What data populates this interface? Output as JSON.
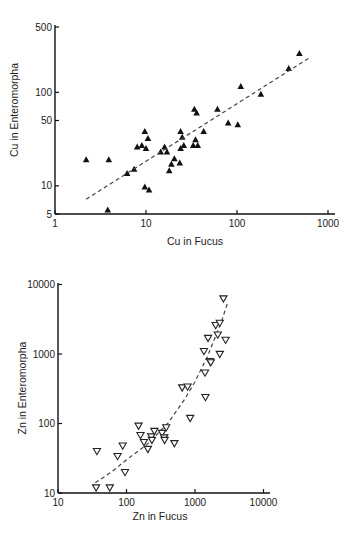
{
  "chart_data": [
    {
      "type": "scatter",
      "title": "",
      "xlabel": "Cu in Fucus",
      "ylabel": "Cu in Enteromorpha",
      "xscale": "log",
      "yscale": "log",
      "xlim": [
        1,
        1000
      ],
      "ylim": [
        5,
        500
      ],
      "xticks": [
        1,
        10,
        100,
        1000
      ],
      "xtick_labels": [
        "1",
        "10",
        "100",
        "1000"
      ],
      "yticks": [
        5,
        10,
        50,
        100,
        500
      ],
      "ytick_labels": [
        "5",
        "10",
        "50",
        "100",
        "500"
      ],
      "grid": false,
      "legend": null,
      "marker": "filled-triangle-up",
      "fit_line": {
        "style": "dashed",
        "from": [
          2.2,
          7.2
        ],
        "to": [
          650,
          240
        ]
      },
      "points": [
        [
          2.2,
          19
        ],
        [
          3.9,
          19
        ],
        [
          3.8,
          5.5
        ],
        [
          6.2,
          13.5
        ],
        [
          7.4,
          15
        ],
        [
          8,
          26
        ],
        [
          9,
          27
        ],
        [
          9.7,
          38
        ],
        [
          10,
          25
        ],
        [
          10.5,
          32
        ],
        [
          9.7,
          9.7
        ],
        [
          10.8,
          9
        ],
        [
          14.5,
          23
        ],
        [
          16,
          26
        ],
        [
          17,
          23
        ],
        [
          19,
          17
        ],
        [
          20.5,
          19.5
        ],
        [
          18,
          14.5
        ],
        [
          23.5,
          17.5
        ],
        [
          24,
          38
        ],
        [
          25,
          33
        ],
        [
          24,
          25
        ],
        [
          26,
          27
        ],
        [
          33,
          27
        ],
        [
          34,
          66
        ],
        [
          36,
          60
        ],
        [
          35,
          31
        ],
        [
          37,
          27
        ],
        [
          43,
          38
        ],
        [
          61,
          66
        ],
        [
          80,
          47
        ],
        [
          102,
          45
        ],
        [
          110,
          115
        ],
        [
          183,
          95
        ],
        [
          370,
          180
        ],
        [
          485,
          260
        ]
      ]
    },
    {
      "type": "scatter",
      "title": "",
      "xlabel": "Zn in Fucus",
      "ylabel": "Zn in Enteromorpha",
      "xscale": "log",
      "yscale": "log",
      "xlim": [
        10,
        10000
      ],
      "ylim": [
        10,
        10000
      ],
      "xticks": [
        10,
        100,
        1000,
        10000
      ],
      "xtick_labels": [
        "10",
        "100",
        "1000",
        "10000"
      ],
      "yticks": [
        10,
        100,
        1000,
        10000
      ],
      "ytick_labels": [
        "10",
        "100",
        "1000",
        "10000"
      ],
      "grid": false,
      "legend": null,
      "marker": "open-triangle-down",
      "fit_line": {
        "style": "dashed",
        "curve": [
          [
            35,
            14
          ],
          [
            60,
            20
          ],
          [
            100,
            30
          ],
          [
            200,
            50
          ],
          [
            400,
            100
          ],
          [
            700,
            220
          ],
          [
            1000,
            400
          ],
          [
            1500,
            900
          ],
          [
            2000,
            1800
          ],
          [
            2500,
            3200
          ],
          [
            3000,
            5500
          ]
        ]
      },
      "points": [
        [
          37,
          40
        ],
        [
          36,
          12
        ],
        [
          57,
          12
        ],
        [
          74,
          34
        ],
        [
          88,
          48
        ],
        [
          95,
          20
        ],
        [
          150,
          93
        ],
        [
          160,
          68
        ],
        [
          180,
          54
        ],
        [
          205,
          43
        ],
        [
          230,
          65
        ],
        [
          235,
          58
        ],
        [
          255,
          78
        ],
        [
          330,
          73
        ],
        [
          355,
          63
        ],
        [
          360,
          58
        ],
        [
          380,
          88
        ],
        [
          500,
          52
        ],
        [
          650,
          330
        ],
        [
          780,
          340
        ],
        [
          850,
          120
        ],
        [
          1350,
          1100
        ],
        [
          1400,
          540
        ],
        [
          1420,
          240
        ],
        [
          1550,
          1700
        ],
        [
          1650,
          790
        ],
        [
          1700,
          760
        ],
        [
          2000,
          2600
        ],
        [
          2150,
          1900
        ],
        [
          2300,
          2800
        ],
        [
          2300,
          1000
        ],
        [
          2800,
          1600
        ],
        [
          2600,
          6300
        ]
      ]
    }
  ],
  "charts": {
    "top": {
      "xlabel": "Cu in Fucus",
      "ylabel": "Cu in Enteromorpha",
      "xtick_labels": [
        "1",
        "10",
        "100",
        "1000"
      ],
      "ytick_labels": [
        "5",
        "10",
        "50",
        "100",
        "500"
      ]
    },
    "bottom": {
      "xlabel": "Zn in Fucus",
      "ylabel": "Zn in Enteromorpha",
      "xtick_labels": [
        "10",
        "100",
        "1000",
        "10000"
      ],
      "ytick_labels": [
        "10",
        "100",
        "1000",
        "10000"
      ]
    }
  },
  "colors": {
    "ink": "#1a1a1a",
    "background": "#ffffff",
    "fit_line": "#444444"
  }
}
